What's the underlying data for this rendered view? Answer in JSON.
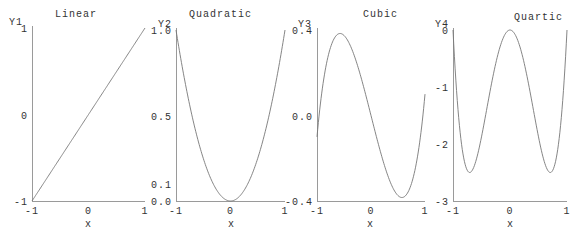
{
  "chart_data": [
    {
      "type": "line",
      "title": "Linear",
      "ylabel": "Y1",
      "xlabel": "x",
      "xlim": [
        -1,
        1
      ],
      "ylim": [
        -1,
        1
      ],
      "xticks": [
        "-1",
        "0",
        "1"
      ],
      "yticks": [
        {
          "v": -1,
          "label": "-1"
        },
        {
          "v": 0,
          "label": "0"
        },
        {
          "v": 1,
          "label": "1"
        }
      ],
      "formula": "x",
      "x": [
        -1,
        -0.5,
        0,
        0.5,
        1
      ],
      "values": [
        -1,
        -0.5,
        0,
        0.5,
        1
      ],
      "grid": false
    },
    {
      "type": "line",
      "title": "Quadratic",
      "ylabel": "Y2",
      "xlabel": "x",
      "xlim": [
        -1,
        1
      ],
      "ylim": [
        0,
        1
      ],
      "xticks": [
        "-1",
        "0",
        "1"
      ],
      "yticks": [
        {
          "v": 0,
          "label": "0.0"
        },
        {
          "v": 0.1,
          "label": "0.1"
        },
        {
          "v": 0.5,
          "label": "0.5"
        },
        {
          "v": 1,
          "label": "1.0"
        }
      ],
      "formula": "x^2",
      "x": [
        -1,
        -0.5,
        0,
        0.5,
        1
      ],
      "values": [
        1,
        0.25,
        0,
        0.25,
        1
      ],
      "grid": false
    },
    {
      "type": "line",
      "title": "Cubic",
      "ylabel": "Y3",
      "xlabel": "x",
      "xlim": [
        -1,
        1
      ],
      "ylim": [
        -0.4,
        0.4
      ],
      "xticks": [
        "-1",
        "0",
        "1"
      ],
      "yticks": [
        {
          "v": -0.4,
          "label": "-0.4"
        },
        {
          "v": 0,
          "label": "0.0"
        },
        {
          "v": 0.4,
          "label": "0.4"
        }
      ],
      "formula": "x^3 - x",
      "x": [
        -1,
        -0.58,
        0,
        0.58,
        1
      ],
      "values": [
        -0.1,
        0.385,
        0,
        -0.385,
        0.1
      ],
      "grid": false
    },
    {
      "type": "line",
      "title": "Quartic",
      "ylabel": "Y4",
      "xlabel": "x",
      "xlim": [
        -1,
        1
      ],
      "ylim": [
        -3,
        0
      ],
      "xticks": [
        "-1",
        "0",
        "1"
      ],
      "yticks": [
        {
          "v": -3,
          "label": "-3"
        },
        {
          "v": -2,
          "label": "-2"
        },
        {
          "v": -1,
          "label": "-1"
        },
        {
          "v": 0,
          "label": "0"
        }
      ],
      "formula": "10x^4 - 10x^2",
      "x": [
        -1,
        -0.71,
        0,
        0.71,
        1
      ],
      "values": [
        0,
        -2.5,
        0,
        -2.5,
        0
      ],
      "grid": false
    }
  ],
  "panels": [
    {
      "title": "Linear",
      "ylabel": "Y1",
      "xlabel": "x"
    },
    {
      "title": "Quadratic",
      "ylabel": "Y2",
      "xlabel": "x"
    },
    {
      "title": "Cubic",
      "ylabel": "Y3",
      "xlabel": "x"
    },
    {
      "title": "Quartic",
      "ylabel": "Y4",
      "xlabel": "x"
    }
  ],
  "colors": {
    "axis": "#9a9a9a",
    "curve": "#777777",
    "text": "#333333",
    "background": "#ffffff"
  }
}
